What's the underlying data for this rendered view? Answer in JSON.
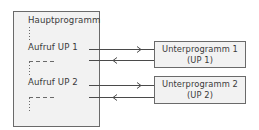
{
  "main_program": {
    "title": "Hauptprogramm",
    "calls": [
      {
        "label": "Aufruf UP 1"
      },
      {
        "label": "Aufruf UP 2"
      }
    ]
  },
  "subprograms": [
    {
      "name": "Unterprogramm 1",
      "abbr": "(UP 1)"
    },
    {
      "name": "Unterprogramm 2",
      "abbr": "(UP 2)"
    }
  ],
  "arrows": [
    {
      "from": "Aufruf UP 1",
      "to": "Unterprogramm 1",
      "direction": "call"
    },
    {
      "from": "Unterprogramm 1",
      "to": "Aufruf UP 1",
      "direction": "return"
    },
    {
      "from": "Aufruf UP 2",
      "to": "Unterprogramm 2",
      "direction": "call"
    },
    {
      "from": "Unterprogramm 2",
      "to": "Aufruf UP 2",
      "direction": "return"
    }
  ],
  "colors": {
    "box_fill": "#f2f2f2",
    "line": "#555555"
  }
}
